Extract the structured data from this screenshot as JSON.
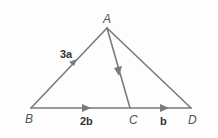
{
  "diagram": {
    "type": "triangle-vectors",
    "points": {
      "A": {
        "label": "A",
        "x": 107,
        "y": 28
      },
      "B": {
        "label": "B",
        "x": 31,
        "y": 108
      },
      "C": {
        "label": "C",
        "x": 130,
        "y": 108
      },
      "D": {
        "label": "D",
        "x": 191,
        "y": 108
      }
    },
    "segments": [
      {
        "from": "B",
        "to": "A",
        "arrow": true,
        "label": "3a"
      },
      {
        "from": "A",
        "to": "C",
        "arrow": true,
        "label": ""
      },
      {
        "from": "A",
        "to": "D",
        "arrow": false,
        "label": ""
      },
      {
        "from": "B",
        "to": "C",
        "arrow": true,
        "label": "2b"
      },
      {
        "from": "C",
        "to": "D",
        "arrow": true,
        "label": "b"
      }
    ],
    "labels": {
      "A": "A",
      "B": "B",
      "C": "C",
      "D": "D",
      "BA": "3a",
      "BC": "2b",
      "CD": "b"
    },
    "colors": {
      "line": "#777777",
      "text": "#444444"
    }
  }
}
